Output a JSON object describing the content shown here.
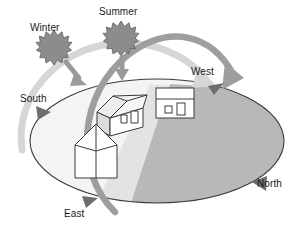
{
  "diagram": {
    "type": "sun-path-diagram"
  },
  "labels": {
    "winter": "Winter",
    "summer": "Summer",
    "west": "West",
    "north": "North",
    "south": "South",
    "east": "East"
  },
  "icons": {
    "winter_sun": "sunburst-icon",
    "summer_sun": "sunburst-icon",
    "winter_ray": "down-arrow-icon",
    "summer_ray": "down-arrow-icon",
    "winter_path": "arc-arrow-icon",
    "summer_path": "arc-arrow-icon",
    "house_isometric": "house-icon",
    "house_elevation": "house-elevation-icon",
    "house_plan": "house-plan-icon",
    "ground_ellipse": "ground-plane-icon"
  },
  "colors": {
    "sun_fill": "#8c8c8c",
    "sun_stroke": "#5a5a5a",
    "summer_arc": "#9a9a9a",
    "winter_arc": "#d2d2d2",
    "ground_outline": "#3a3a3a",
    "shadow_dark": "#b6b6b6",
    "shadow_light": "#e2e2e2",
    "ground_light": "#f2f2f2",
    "label_text": "#1a1a1a",
    "house_stroke": "#3a3a3a",
    "house_fill": "#ffffff",
    "roof_fill": "#ededed",
    "side_fill": "#d8d8d8"
  },
  "directions": [
    "South",
    "West",
    "North",
    "East"
  ],
  "seasons": [
    "Winter",
    "Summer"
  ]
}
